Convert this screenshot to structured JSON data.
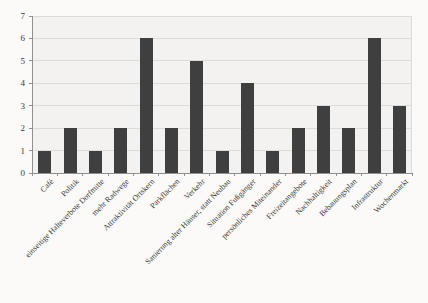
{
  "chart_data": {
    "type": "bar",
    "title": "",
    "xlabel": "",
    "ylabel": "",
    "categories": [
      "Café",
      "Politik",
      "einseitige Halteverbote Dorfmitte",
      "mehr Radwege",
      "Attraktivität Ortskern",
      "Parkflächen",
      "Verkehr",
      "Sanierung alter Häuser, statt Neubau",
      "Situation Fußgänger",
      "persönliches Miteinander",
      "Freizeitangebote",
      "Nachhaltigkeit",
      "Bebauungsplan",
      "Infrastruktur",
      "Wochenmarkt"
    ],
    "values": [
      1,
      2,
      1,
      2,
      6,
      2,
      5,
      1,
      4,
      1,
      2,
      3,
      2,
      6,
      3
    ],
    "ylim": [
      0,
      7
    ],
    "ytick_step": 1,
    "grid": true,
    "legend": false,
    "x_label_rotation_deg": 45,
    "colors": {
      "bar": "#3f3f3f",
      "gridline": "#dcdbd8",
      "axis": "#8f8f8f",
      "plot_background": "#f3f2f0",
      "page_background": "#fbfaf8",
      "text": "#3a3a3a"
    }
  }
}
